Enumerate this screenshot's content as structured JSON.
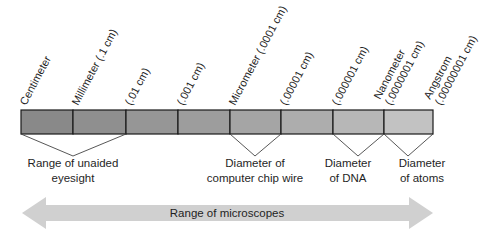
{
  "scale": {
    "cells": [
      {
        "label": "Centimeter",
        "x": 21,
        "color": "#898989"
      },
      {
        "label": "Millimeter (.1 cm)",
        "x": 73,
        "color": "#8f8f8f"
      },
      {
        "label": "(.01 cm)",
        "x": 126,
        "color": "#969696"
      },
      {
        "label": "(.001 cm)",
        "x": 178,
        "color": "#9d9d9d"
      },
      {
        "label": "Micrometer (.0001 cm)",
        "x": 230,
        "color": "#a5a5a5"
      },
      {
        "label": "(.00001 cm)",
        "x": 281,
        "color": "#adadad"
      },
      {
        "label": "(.000001 cm)",
        "x": 333,
        "color": "#b7b7b7"
      },
      {
        "label": "Nanometer",
        "label2": "(.0000001 cm)",
        "x": 384,
        "color": "#c2c2c2"
      }
    ],
    "end_label": {
      "label": "Angstrom",
      "label2": "(.00000001 cm)",
      "x": 433
    }
  },
  "callouts": [
    {
      "line1": "Range of unaided",
      "line2": "eyesight"
    },
    {
      "line1": "Diameter of",
      "line2": "computer chip wire"
    },
    {
      "line1": "Diameter",
      "line2": "of DNA"
    },
    {
      "line1": "Diameter",
      "line2": "of atoms"
    }
  ],
  "arrow": {
    "label": "Range of microscopes",
    "color": "#d0d0d0"
  }
}
